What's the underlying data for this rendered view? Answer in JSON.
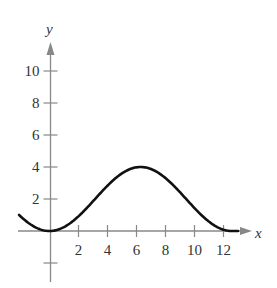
{
  "chart_data": {
    "type": "line",
    "title": "",
    "xlabel": "x",
    "ylabel": "y",
    "xlim": [
      -2.1,
      13.5
    ],
    "ylim": [
      -3,
      11
    ],
    "x_ticks": [
      2,
      4,
      6,
      8,
      10,
      12
    ],
    "x_tick_labels": [
      "2",
      "4",
      "6",
      "8",
      "10",
      "12"
    ],
    "y_ticks": [
      2,
      4,
      6,
      8,
      10
    ],
    "y_tick_labels": [
      "2",
      "4",
      "6",
      "8",
      "10"
    ],
    "y_unlabeled_ticks": [
      -2
    ],
    "grid": false,
    "legend": null,
    "series": [
      {
        "name": "curve",
        "color": "#111111",
        "function_hint": "y = 2(1 - cos(x/2))",
        "x": [
          -2,
          -1,
          0,
          1,
          2,
          3,
          4,
          5,
          6,
          6.28,
          7,
          8,
          9,
          10,
          11,
          12,
          12.57,
          13
        ],
        "y": [
          0.92,
          0.24,
          0,
          0.24,
          0.92,
          1.86,
          2.83,
          3.6,
          3.98,
          4,
          3.87,
          3.31,
          2.42,
          1.43,
          0.59,
          0.08,
          0,
          0.05
        ]
      }
    ]
  },
  "colors": {
    "axis": "#888888",
    "curve": "#111111",
    "text": "#333333"
  }
}
